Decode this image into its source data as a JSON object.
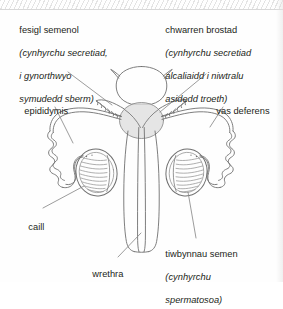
{
  "diagram": {
    "language": "Welsh",
    "type": "anatomical-diagram",
    "background_color": "#fefefe",
    "ink_color": "#231f20",
    "line_color": "#6f6f6f",
    "shade_color": "#dcdcdc"
  },
  "labels": {
    "seminal_vesicle": {
      "line1": "fesigl semenol",
      "line2": "(cynhyrchu secretiad,",
      "line3": "i gynorthwyo",
      "line4": "symudedd sberm)"
    },
    "prostate": {
      "line1": "chwarren brostad",
      "line2": "(cynhyrchu secretiad",
      "line3": "alcaliaidd i niwtralu",
      "line4": "asidedd troeth)"
    },
    "epididymis": {
      "line1": "epididymis"
    },
    "vas_deferens": {
      "line1": "vas deferens"
    },
    "testis": {
      "line1": "caill"
    },
    "urethra": {
      "line1": "wrethra"
    },
    "seminiferous_tubules": {
      "line1": "tiwbynnau semen",
      "line2": "(cynhyrchu",
      "line3": "spermatosoa)"
    }
  },
  "structures": [
    {
      "name": "bladder",
      "label_key": "none"
    },
    {
      "name": "seminal-vesicle-left",
      "label_key": "seminal_vesicle"
    },
    {
      "name": "seminal-vesicle-right",
      "label_key": "seminal_vesicle"
    },
    {
      "name": "prostate-gland",
      "label_key": "prostate"
    },
    {
      "name": "vas-deferens-left",
      "label_key": "vas_deferens"
    },
    {
      "name": "vas-deferens-right",
      "label_key": "vas_deferens"
    },
    {
      "name": "epididymis-left",
      "label_key": "epididymis"
    },
    {
      "name": "epididymis-right",
      "label_key": "epididymis"
    },
    {
      "name": "testis-left",
      "label_key": "testis"
    },
    {
      "name": "testis-right",
      "label_key": "testis"
    },
    {
      "name": "penis-shaft",
      "label_key": "none"
    },
    {
      "name": "urethra-canal",
      "label_key": "urethra"
    }
  ]
}
